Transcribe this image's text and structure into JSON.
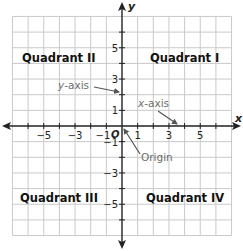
{
  "diagram": {
    "axes": {
      "x_label": "x",
      "y_label": "y",
      "x_range": [
        -7,
        7
      ],
      "y_range": [
        -7,
        7
      ]
    },
    "x_ticks": [
      {
        "value": -5,
        "label": "−5"
      },
      {
        "value": -3,
        "label": "−3"
      },
      {
        "value": -1,
        "label": "−1"
      },
      {
        "value": 1,
        "label": "1"
      },
      {
        "value": 3,
        "label": "3"
      },
      {
        "value": 5,
        "label": "5"
      }
    ],
    "y_ticks": [
      {
        "value": 5,
        "label": "5"
      },
      {
        "value": 3,
        "label": "3"
      },
      {
        "value": 1,
        "label": "1"
      },
      {
        "value": -1,
        "label": "−1"
      },
      {
        "value": -3,
        "label": "−3"
      },
      {
        "value": -5,
        "label": "−5"
      }
    ],
    "origin_label": "O",
    "quadrants": {
      "q1": "Quadrant I",
      "q2": "Quadrant II",
      "q3": "Quadrant III",
      "q4": "Quadrant IV"
    },
    "annotations": {
      "y_axis": {
        "italic": "y",
        "rest": "-axis"
      },
      "x_axis": {
        "italic": "x",
        "rest": "-axis"
      },
      "origin": "Origin"
    },
    "colors": {
      "grid": "#c9c9c9",
      "axis": "#222222",
      "annotation": "#6d6d6d",
      "arrow": "#555555"
    }
  }
}
